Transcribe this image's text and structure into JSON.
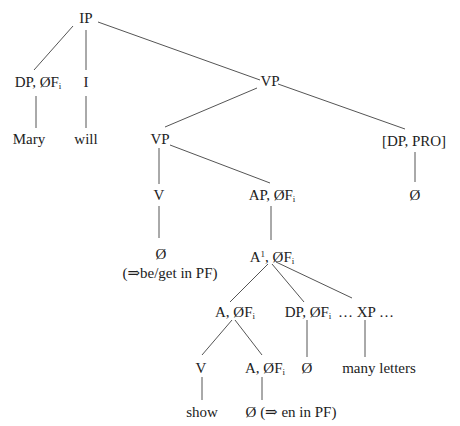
{
  "diagram": {
    "type": "syntax-tree",
    "nodes": {
      "ip": {
        "label": "IP"
      },
      "dp_subj": {
        "label": "DP, ØF",
        "sub": "i"
      },
      "i": {
        "label": "I"
      },
      "vp_top": {
        "label": "VP"
      },
      "mary": {
        "label": "Mary"
      },
      "will": {
        "label": "will"
      },
      "vp_inner": {
        "label": "VP"
      },
      "dp_pro": {
        "label": "[DP, PRO]"
      },
      "v": {
        "label": "V"
      },
      "ap": {
        "label": "AP, ØF",
        "sub": "i"
      },
      "null_pro": {
        "label": "Ø"
      },
      "null_v": {
        "label": "Ø"
      },
      "be_get": {
        "label": "(⇒be/get in PF)"
      },
      "a_bar": {
        "label": "A",
        "sup": "1",
        "rest": ", ØF",
        "sub": "i"
      },
      "a": {
        "label": "A, ØF",
        "sub": "i"
      },
      "dp_obj": {
        "label": "DP, ØF",
        "sub": "i"
      },
      "xp": {
        "label": "… XP …"
      },
      "v_show": {
        "label": "V"
      },
      "a_en": {
        "label": "A, ØF",
        "sub": "i"
      },
      "null_dp": {
        "label": "Ø"
      },
      "many_letters": {
        "label": "many letters"
      },
      "show": {
        "label": "show"
      },
      "null_en": {
        "label": "Ø (⇒ en in PF)"
      }
    },
    "edges": [
      [
        "ip",
        "dp_subj"
      ],
      [
        "ip",
        "i"
      ],
      [
        "ip",
        "vp_top"
      ],
      [
        "dp_subj",
        "mary"
      ],
      [
        "i",
        "will"
      ],
      [
        "vp_top",
        "vp_inner"
      ],
      [
        "vp_top",
        "dp_pro"
      ],
      [
        "vp_inner",
        "v"
      ],
      [
        "vp_inner",
        "ap"
      ],
      [
        "dp_pro",
        "null_pro"
      ],
      [
        "v",
        "null_v"
      ],
      [
        "ap",
        "a_bar"
      ],
      [
        "a_bar",
        "a"
      ],
      [
        "a_bar",
        "dp_obj"
      ],
      [
        "a_bar",
        "xp"
      ],
      [
        "a",
        "v_show"
      ],
      [
        "a",
        "a_en"
      ],
      [
        "dp_obj",
        "null_dp"
      ],
      [
        "xp",
        "many_letters"
      ],
      [
        "v_show",
        "show"
      ],
      [
        "a_en",
        "null_en"
      ]
    ]
  }
}
